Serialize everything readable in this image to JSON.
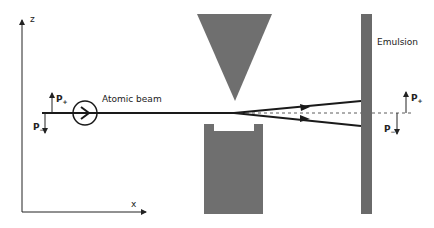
{
  "axes": {
    "z_label": "z",
    "x_label": "x"
  },
  "labels": {
    "atomic_beam": "Atomic beam",
    "emulsion": "Emulsion",
    "p_plus_main": "P",
    "p_plus_sub": "+",
    "p_minus_main": "P",
    "p_minus_sub": "−"
  },
  "colors": {
    "beam": "#1a1a1a",
    "magnet": "#6f6f6f",
    "emulsion": "#6a6a6a",
    "line": "#222222"
  }
}
